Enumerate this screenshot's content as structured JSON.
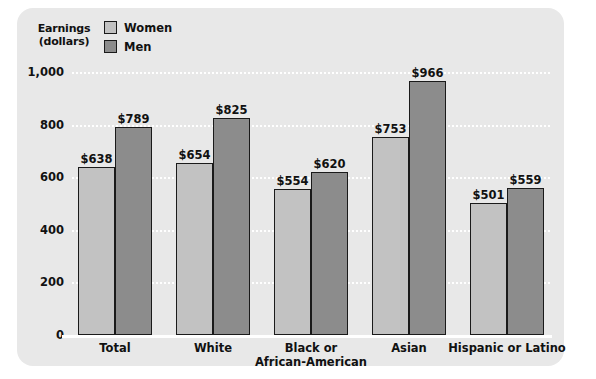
{
  "chart_data": {
    "type": "bar",
    "title": "",
    "ylabel": "Earnings (dollars)",
    "ylabel_lines": [
      "Earnings",
      "(dollars)"
    ],
    "xlabel": "",
    "ylim": [
      0,
      1000
    ],
    "ytick_labels": [
      "1,000",
      "800",
      "600",
      "400",
      "200",
      "0"
    ],
    "ytick_values": [
      1000,
      800,
      600,
      400,
      200,
      0
    ],
    "grid": true,
    "grid_style": "dotted-white",
    "legend_position": "top-left",
    "categories": [
      "Total",
      "White",
      "Black or African-American",
      "Asian",
      "Hispanic or Latino"
    ],
    "category_label_lines": [
      [
        "Total"
      ],
      [
        "White"
      ],
      [
        "Black or",
        "African-American"
      ],
      [
        "Asian"
      ],
      [
        "Hispanic or Latino"
      ]
    ],
    "series": [
      {
        "name": "Women",
        "color": "#c2c2c2",
        "values": [
          638,
          654,
          554,
          753,
          501
        ],
        "data_labels": [
          "$638",
          "$654",
          "$554",
          "$753",
          "$501"
        ]
      },
      {
        "name": "Men",
        "color": "#8c8c8c",
        "values": [
          789,
          825,
          620,
          966,
          559
        ],
        "data_labels": [
          "$789",
          "$825",
          "$620",
          "$966",
          "$559"
        ]
      }
    ]
  },
  "legend": {
    "items": [
      {
        "label": "Women",
        "color": "#c2c2c2"
      },
      {
        "label": "Men",
        "color": "#8c8c8c"
      }
    ]
  },
  "colors": {
    "panel_background": "#e8e8e8",
    "page_background": "#ffffff",
    "bar_outline": "#1a1a1a",
    "gridline": "#ffffff",
    "text": "#111111"
  }
}
